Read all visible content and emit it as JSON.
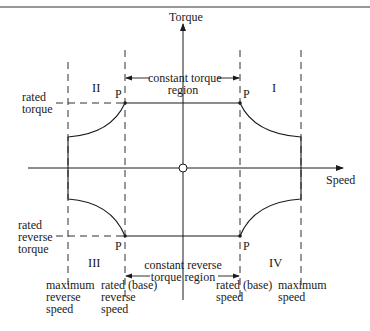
{
  "axes": {
    "y_label": "Torque",
    "x_label": "Speed"
  },
  "quadrants": {
    "q1": "I",
    "q2": "II",
    "q3": "III",
    "q4": "IV"
  },
  "points": {
    "p1": "P",
    "p2": "P",
    "p3": "P",
    "p4": "P"
  },
  "regions": {
    "constant_torque_line1": "constant torque",
    "constant_torque_line2": "region",
    "constant_reverse_line1": "constant reverse",
    "constant_reverse_line2": "torque region"
  },
  "left_labels": {
    "rated_torque_1": "rated",
    "rated_torque_2": "torque",
    "rated_reverse_1": "rated",
    "rated_reverse_2": "reverse",
    "rated_reverse_3": "torque"
  },
  "bottom_labels": {
    "max_reverse_1": "maximum",
    "max_reverse_2": "reverse",
    "max_reverse_3": "speed",
    "base_reverse_1": "rated (base)",
    "base_reverse_2": "reverse",
    "base_reverse_3": "speed",
    "base_speed_1": "rated (base)",
    "base_speed_2": "speed",
    "max_speed_1": "maximum",
    "max_speed_2": "speed"
  },
  "colors": {
    "ink": "#1a1a1a",
    "background": "#ffffff"
  }
}
